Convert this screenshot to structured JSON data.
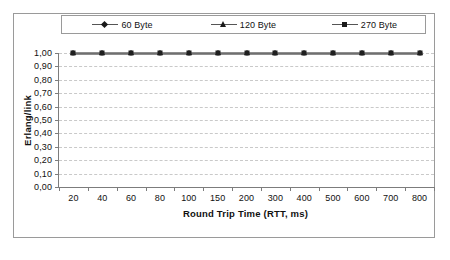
{
  "chart_data": {
    "type": "line",
    "title": "",
    "xlabel": "Round Trip Time (RTT, ms)",
    "ylabel": "Erlang/link",
    "categories": [
      "20",
      "40",
      "60",
      "80",
      "100",
      "150",
      "200",
      "300",
      "400",
      "500",
      "600",
      "700",
      "800"
    ],
    "series": [
      {
        "name": "60 Byte",
        "marker": "diamond",
        "values": [
          1.0,
          1.0,
          1.0,
          1.0,
          1.0,
          1.0,
          1.0,
          1.0,
          1.0,
          1.0,
          1.0,
          1.0,
          1.0
        ]
      },
      {
        "name": "120 Byte",
        "marker": "triangle",
        "values": [
          1.0,
          1.0,
          1.0,
          1.0,
          1.0,
          1.0,
          1.0,
          1.0,
          1.0,
          1.0,
          1.0,
          1.0,
          1.0
        ]
      },
      {
        "name": "270 Byte",
        "marker": "square",
        "values": [
          1.0,
          1.0,
          1.0,
          1.0,
          1.0,
          1.0,
          1.0,
          1.0,
          1.0,
          1.0,
          1.0,
          1.0,
          1.0
        ]
      }
    ],
    "ylim": [
      0.0,
      1.0
    ],
    "yticks": [
      "0,00",
      "0,10",
      "0,20",
      "0,30",
      "0,40",
      "0,50",
      "0,60",
      "0,70",
      "0,80",
      "0,90",
      "1,00"
    ],
    "ytick_values": [
      0.0,
      0.1,
      0.2,
      0.3,
      0.4,
      0.5,
      0.6,
      0.7,
      0.8,
      0.9,
      1.0
    ],
    "grid": "horizontal-dashed",
    "legend_position": "top",
    "colors": {
      "line": "#8d8d8d",
      "marker": "#1f1f1f",
      "axis": "#7c7c7c",
      "grid": "#c9c9c9",
      "frame": "#9a9a9a",
      "background": "#ffffff",
      "text": "#111111"
    }
  },
  "legend": {
    "items": [
      {
        "label": "60 Byte",
        "marker": "diamond-marker-icon"
      },
      {
        "label": "120 Byte",
        "marker": "triangle-marker-icon"
      },
      {
        "label": "270 Byte",
        "marker": "square-marker-icon"
      }
    ]
  },
  "axes": {
    "x_title": "Round Trip Time (RTT, ms)",
    "y_title": "Erlang/link"
  }
}
